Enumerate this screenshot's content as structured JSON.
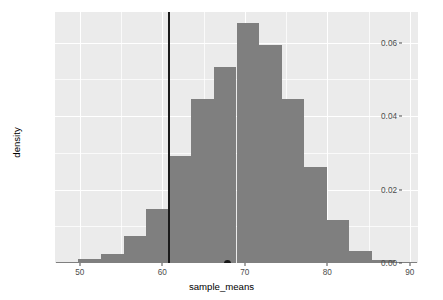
{
  "chart_data": {
    "type": "bar",
    "title": "",
    "subtitle": "",
    "xlabel": "sample_means",
    "ylabel": "density",
    "xlim": [
      47.0,
      91.0
    ],
    "ylim": [
      0.0,
      0.0683
    ],
    "grid": true,
    "legend_position": "none",
    "bin_width": 2.73,
    "x_ticks": [
      50,
      60,
      70,
      80,
      90
    ],
    "x_tick_labels": [
      "50",
      "60",
      "70",
      "80",
      "90"
    ],
    "y_ticks": [
      0.0,
      0.02,
      0.04,
      0.06
    ],
    "y_tick_labels": [
      "0.00",
      "0.02",
      "0.04",
      "0.06"
    ],
    "bin_centers": [
      48.5,
      51.2,
      54.0,
      56.7,
      59.4,
      62.2,
      64.9,
      67.6,
      70.4,
      73.1,
      75.8,
      78.6,
      81.3,
      84.0,
      86.8,
      89.5
    ],
    "values": [
      0.0004,
      0.0012,
      0.0025,
      0.0073,
      0.0146,
      0.0291,
      0.0445,
      0.0533,
      0.0652,
      0.0592,
      0.0445,
      0.0261,
      0.0116,
      0.0034,
      0.0008,
      0.0004
    ],
    "categories": [
      "48.5",
      "51.2",
      "54.0",
      "56.7",
      "59.4",
      "62.2",
      "64.9",
      "67.6",
      "70.4",
      "73.1",
      "75.8",
      "78.6",
      "81.3",
      "84.0",
      "86.8",
      "89.5"
    ],
    "annotations": [
      {
        "name": "reference-vline",
        "kind": "vline",
        "x": 60.8,
        "color": "#1a1a1a"
      },
      {
        "name": "observed-point",
        "kind": "point",
        "x": 67.9,
        "y": 0.0,
        "color": "#1a1a1a"
      }
    ],
    "colors": {
      "bar_fill": "#7f7f7f",
      "panel_background": "#ebebeb",
      "grid_line": "#ffffff",
      "annotation": "#1a1a1a",
      "axis_text": "#4d4d4d",
      "axis_title": "#000000",
      "plot_background": "#ffffff"
    }
  },
  "axes": {
    "x_title": "sample_means",
    "y_title": "density",
    "x_tick_labels": [
      "50",
      "60",
      "70",
      "80",
      "90"
    ],
    "y_tick_labels": [
      "0.00",
      "0.02",
      "0.04",
      "0.06"
    ]
  }
}
